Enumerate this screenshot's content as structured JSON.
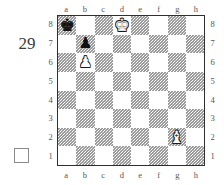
{
  "diagram": {
    "puzzle_number": "29",
    "side_to_move_marker": "white-square",
    "side_to_move": "white"
  },
  "board": {
    "files": [
      "a",
      "b",
      "c",
      "d",
      "e",
      "f",
      "g",
      "h"
    ],
    "ranks": [
      "8",
      "7",
      "6",
      "5",
      "4",
      "3",
      "2",
      "1"
    ],
    "orientation": "white-bottom",
    "border_color": "#2f2f2f",
    "light_square_color": "#ffffff",
    "dark_square_color": "#9a9a9a"
  },
  "chart_data": {
    "type": "table",
    "title": "29",
    "pieces": [
      {
        "square": "a8",
        "file": "a",
        "rank": "8",
        "color": "black",
        "type": "king",
        "glyph": "♚"
      },
      {
        "square": "d8",
        "file": "d",
        "rank": "8",
        "color": "white",
        "type": "king",
        "glyph": "♚"
      },
      {
        "square": "b7",
        "file": "b",
        "rank": "7",
        "color": "black",
        "type": "pawn",
        "glyph": "♟"
      },
      {
        "square": "b6",
        "file": "b",
        "rank": "6",
        "color": "white",
        "type": "pawn",
        "glyph": "♟"
      },
      {
        "square": "g2",
        "file": "g",
        "rank": "2",
        "color": "white",
        "type": "bishop",
        "glyph": "♝"
      }
    ]
  }
}
